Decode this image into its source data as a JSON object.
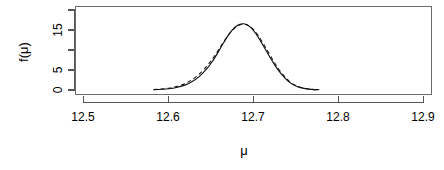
{
  "chart_data": {
    "type": "line",
    "title": "",
    "subtitle": "",
    "xlabel": "μ",
    "ylabel": "f(μ)",
    "xlim": [
      12.45,
      12.95
    ],
    "ylim": [
      -0.6,
      19.0
    ],
    "xticks": [
      12.5,
      12.6,
      12.7,
      12.8,
      12.9
    ],
    "xticklabels": [
      "12.5",
      "12.6",
      "12.7",
      "12.8",
      "12.9"
    ],
    "yticks": [
      0,
      5,
      10,
      15,
      20
    ],
    "yticklabels": [
      "0",
      "5",
      "",
      "15",
      ""
    ],
    "grid": false,
    "legend": "none",
    "box": "full-rectangle",
    "series": [
      {
        "name": "posterior-density",
        "style": "solid",
        "color": "#111111",
        "x": [
          12.583,
          12.592,
          12.601,
          12.61,
          12.619,
          12.628,
          12.637,
          12.646,
          12.652,
          12.658,
          12.664,
          12.67,
          12.676,
          12.682,
          12.688,
          12.692,
          12.697,
          12.703,
          12.709,
          12.715,
          12.721,
          12.727,
          12.733,
          12.742,
          12.751,
          12.76,
          12.769,
          12.778
        ],
        "y": [
          0.1,
          0.18,
          0.32,
          0.62,
          1.15,
          2.05,
          3.4,
          5.4,
          7.1,
          9.1,
          11.3,
          13.4,
          15.1,
          16.2,
          16.55,
          16.4,
          15.7,
          14.2,
          12.2,
          10.0,
          7.8,
          5.8,
          4.1,
          2.1,
          0.95,
          0.4,
          0.16,
          0.06
        ]
      },
      {
        "name": "normal-approximation",
        "style": "dashed",
        "color": "#111111",
        "x": [
          12.583,
          12.592,
          12.601,
          12.61,
          12.619,
          12.628,
          12.637,
          12.646,
          12.652,
          12.658,
          12.664,
          12.67,
          12.676,
          12.682,
          12.688,
          12.692,
          12.697,
          12.703,
          12.709,
          12.715,
          12.721,
          12.727,
          12.733,
          12.742,
          12.751,
          12.76,
          12.769,
          12.778
        ],
        "y": [
          0.14,
          0.26,
          0.46,
          0.85,
          1.5,
          2.55,
          4.05,
          6.05,
          7.7,
          9.55,
          11.55,
          13.45,
          15.0,
          16.05,
          16.45,
          16.35,
          15.8,
          14.55,
          12.7,
          10.55,
          8.35,
          6.25,
          4.45,
          2.3,
          1.05,
          0.44,
          0.17,
          0.06
        ]
      }
    ],
    "peak": {
      "x": 12.692,
      "y": 16.55
    }
  },
  "axes": {
    "x_tick_labels": [
      "12.5",
      "12.6",
      "12.7",
      "12.8",
      "12.9"
    ],
    "y_tick_labels": [
      "0",
      "5",
      "15"
    ],
    "x_axis_title": "μ",
    "y_axis_title": "f(μ)"
  },
  "style": {
    "background": "#ffffff",
    "axis_color": "#555555",
    "box_color": "#6b6b6b",
    "curve_color": "#111111"
  }
}
